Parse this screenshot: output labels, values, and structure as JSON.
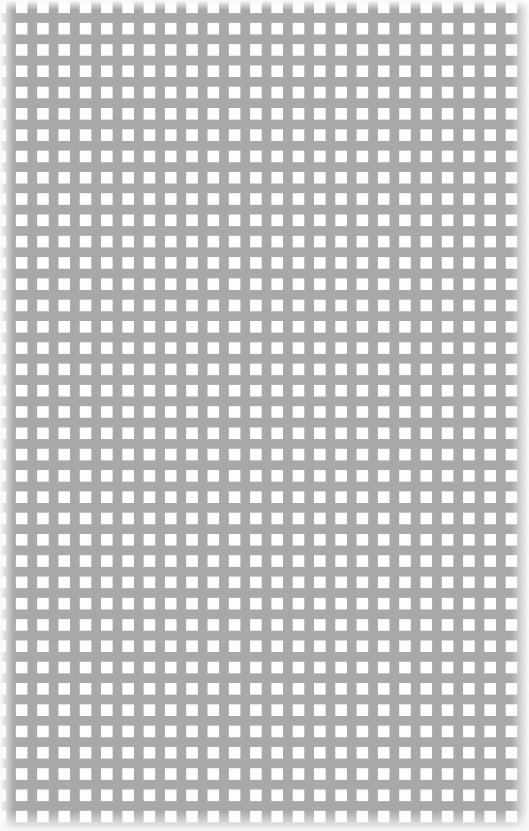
{
  "canvas": {
    "name": "cross-grid-canvas",
    "width": 529,
    "height": 831,
    "background_color": "#fdfdfd",
    "description": "Blank document surface filled with a uniform grid of small light-gray plus/cross registration marks. No text, controls, or chrome are present.",
    "alt_text": ""
  },
  "grid": {
    "name": "plus-mark-grid",
    "mark_glyph": "+",
    "mark_color": "#a8a8a8",
    "stroke_width_px": 1,
    "arm_span_px": 9,
    "spacing_x_px": 21.3,
    "spacing_y_px": 21.3,
    "first_mark_center_x_px": 11,
    "first_mark_center_y_px": 18,
    "columns": 25,
    "rows": 39,
    "total_marks": 975
  },
  "edges": {
    "name": "page-edge-shading",
    "left_highlight_color": "#fafafa",
    "right_highlight_color": "#f8f8f8",
    "bottom_highlight_color": "#fafafa",
    "top_sheen_color": "#fdfdfd"
  },
  "content": {
    "text_elements": [],
    "controls": [],
    "icons": []
  }
}
